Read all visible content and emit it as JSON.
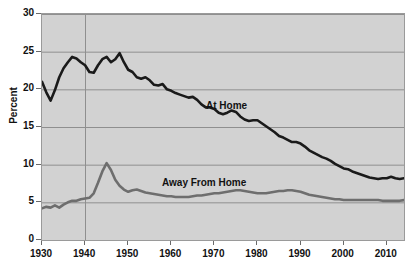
{
  "chart_data": {
    "type": "line",
    "title": "",
    "xlabel": "",
    "ylabel": "Percent",
    "xlim": [
      1930,
      2014
    ],
    "ylim": [
      0,
      30
    ],
    "grid": true,
    "grid_y_step": 5,
    "grid_x_lines": [
      1940
    ],
    "legend_position": "inline-annotations",
    "background_color": "#d2d2d2",
    "x_tick_labels": [
      "1930",
      "1940",
      "1950",
      "1960",
      "1970",
      "1980",
      "1990",
      "2000",
      "2010"
    ],
    "x_ticks": [
      1930,
      1940,
      1950,
      1960,
      1970,
      1980,
      1990,
      2000,
      2010
    ],
    "y_tick_labels": [
      "0",
      "5",
      "10",
      "15",
      "20",
      "25",
      "30"
    ],
    "y_ticks": [
      0,
      5,
      10,
      15,
      20,
      25,
      30
    ],
    "annotations": [
      {
        "text": "At Home",
        "x": 1974,
        "y": 17.8
      },
      {
        "text": "Away From Home",
        "x": 1963,
        "y": 8.6
      }
    ],
    "series": [
      {
        "name": "At Home",
        "color": "#1a1a1a",
        "line_width": 2.6,
        "x": [
          1930,
          1931,
          1932,
          1933,
          1934,
          1935,
          1936,
          1937,
          1938,
          1939,
          1940,
          1941,
          1942,
          1943,
          1944,
          1945,
          1946,
          1947,
          1948,
          1949,
          1950,
          1951,
          1952,
          1953,
          1954,
          1955,
          1956,
          1957,
          1958,
          1959,
          1960,
          1961,
          1962,
          1963,
          1964,
          1965,
          1966,
          1967,
          1968,
          1969,
          1970,
          1971,
          1972,
          1973,
          1974,
          1975,
          1976,
          1977,
          1978,
          1979,
          1980,
          1981,
          1982,
          1983,
          1984,
          1985,
          1986,
          1987,
          1988,
          1989,
          1990,
          1991,
          1992,
          1993,
          1994,
          1995,
          1996,
          1997,
          1998,
          1999,
          2000,
          2001,
          2002,
          2003,
          2004,
          2005,
          2006,
          2007,
          2008,
          2009,
          2010,
          2011,
          2012,
          2013,
          2014
        ],
        "y": [
          21.0,
          19.6,
          18.5,
          19.9,
          21.6,
          22.8,
          23.6,
          24.3,
          24.1,
          23.6,
          23.2,
          22.3,
          22.2,
          23.2,
          24.0,
          24.3,
          23.6,
          24.0,
          24.8,
          23.6,
          22.6,
          22.3,
          21.6,
          21.4,
          21.6,
          21.2,
          20.6,
          20.5,
          20.7,
          20.0,
          19.8,
          19.5,
          19.3,
          19.1,
          18.9,
          19.0,
          18.6,
          18.0,
          17.6,
          17.6,
          17.4,
          16.9,
          16.7,
          16.9,
          17.2,
          17.0,
          16.4,
          16.0,
          15.8,
          15.9,
          15.9,
          15.5,
          15.1,
          14.7,
          14.3,
          13.8,
          13.6,
          13.3,
          13.0,
          13.0,
          12.8,
          12.4,
          11.9,
          11.6,
          11.3,
          11.0,
          10.8,
          10.5,
          10.1,
          9.8,
          9.5,
          9.4,
          9.1,
          8.9,
          8.7,
          8.5,
          8.3,
          8.2,
          8.1,
          8.2,
          8.2,
          8.4,
          8.2,
          8.1,
          8.2
        ]
      },
      {
        "name": "Away From Home",
        "color": "#6e6e6e",
        "line_width": 2.6,
        "x": [
          1930,
          1931,
          1932,
          1933,
          1934,
          1935,
          1936,
          1937,
          1938,
          1939,
          1940,
          1941,
          1942,
          1943,
          1944,
          1945,
          1946,
          1947,
          1948,
          1949,
          1950,
          1951,
          1952,
          1953,
          1954,
          1955,
          1956,
          1957,
          1958,
          1959,
          1960,
          1961,
          1962,
          1963,
          1964,
          1965,
          1966,
          1967,
          1968,
          1969,
          1970,
          1971,
          1972,
          1973,
          1974,
          1975,
          1976,
          1977,
          1978,
          1979,
          1980,
          1981,
          1982,
          1983,
          1984,
          1985,
          1986,
          1987,
          1988,
          1989,
          1990,
          1991,
          1992,
          1993,
          1994,
          1995,
          1996,
          1997,
          1998,
          1999,
          2000,
          2001,
          2002,
          2003,
          2004,
          2005,
          2006,
          2007,
          2008,
          2009,
          2010,
          2011,
          2012,
          2013,
          2014
        ],
        "y": [
          4.2,
          4.4,
          4.3,
          4.6,
          4.3,
          4.7,
          5.0,
          5.2,
          5.2,
          5.4,
          5.5,
          5.6,
          6.2,
          7.6,
          9.1,
          10.2,
          9.3,
          8.0,
          7.2,
          6.7,
          6.4,
          6.6,
          6.7,
          6.5,
          6.3,
          6.2,
          6.1,
          6.0,
          5.9,
          5.8,
          5.8,
          5.7,
          5.7,
          5.7,
          5.7,
          5.8,
          5.9,
          5.9,
          6.0,
          6.1,
          6.2,
          6.2,
          6.3,
          6.4,
          6.5,
          6.6,
          6.6,
          6.5,
          6.4,
          6.3,
          6.2,
          6.2,
          6.2,
          6.3,
          6.4,
          6.5,
          6.5,
          6.6,
          6.6,
          6.5,
          6.4,
          6.2,
          6.0,
          5.9,
          5.8,
          5.7,
          5.6,
          5.5,
          5.4,
          5.4,
          5.3,
          5.3,
          5.3,
          5.3,
          5.3,
          5.3,
          5.3,
          5.3,
          5.3,
          5.2,
          5.2,
          5.2,
          5.2,
          5.2,
          5.3
        ]
      }
    ]
  }
}
